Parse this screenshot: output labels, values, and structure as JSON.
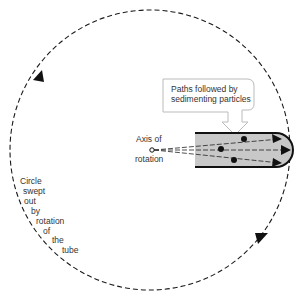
{
  "labels": {
    "paths": [
      "Paths followed by",
      "sedimenting particles"
    ],
    "axis": [
      "Axis of",
      "rotation"
    ],
    "circle": [
      "Circle",
      "swept",
      "out",
      "by",
      "rotation",
      "of",
      "the",
      "tube"
    ]
  },
  "colors": {
    "line": "#1a1a1a",
    "tube_fill": "#c8c8c8",
    "callout_border": "#bbbbbb"
  }
}
